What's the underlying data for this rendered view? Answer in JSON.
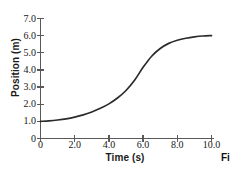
{
  "figure": {
    "caption_fragment": "Fi",
    "background_color": "#ffffff",
    "axis_color": "#595959",
    "curve_color": "#2b2b2b",
    "text_color": "#171717"
  },
  "chart_data": {
    "type": "line",
    "title": "",
    "subtitle": "",
    "xlabel": "Time (s)",
    "ylabel": "Position (m)",
    "xlim": [
      0,
      10
    ],
    "ylim": [
      0,
      7
    ],
    "grid": false,
    "legend": false,
    "legend_position": "none",
    "xticks": [
      0,
      2,
      4,
      6,
      8,
      10
    ],
    "xtick_labels": [
      "0",
      "2.0",
      "4.0",
      "6.0",
      "8.0",
      "10.0"
    ],
    "yticks": [
      0,
      1,
      2,
      3,
      4,
      5,
      6,
      7
    ],
    "ytick_labels": [
      "0",
      "1.0",
      "2.0",
      "3.0",
      "4.0",
      "5.0",
      "6.0",
      "7.0"
    ],
    "series": [
      {
        "name": "position",
        "color": "#2b2b2b",
        "x": [
          0.0,
          0.5,
          1.0,
          1.5,
          2.0,
          2.5,
          3.0,
          3.5,
          4.0,
          4.5,
          5.0,
          5.5,
          6.0,
          6.5,
          7.0,
          7.5,
          8.0,
          8.5,
          9.0,
          9.5,
          10.0
        ],
        "y": [
          1.0,
          1.03,
          1.08,
          1.15,
          1.25,
          1.38,
          1.55,
          1.76,
          2.02,
          2.36,
          2.8,
          3.4,
          4.15,
          4.8,
          5.25,
          5.55,
          5.73,
          5.85,
          5.93,
          5.98,
          6.0
        ]
      }
    ],
    "annotations": []
  }
}
